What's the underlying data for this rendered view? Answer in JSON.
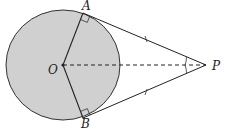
{
  "diagram": {
    "type": "geometry",
    "points": {
      "O": {
        "label": "O",
        "x": 63,
        "y": 65
      },
      "A": {
        "label": "A",
        "x": 83,
        "y": 13
      },
      "B": {
        "label": "B",
        "x": 83,
        "y": 118
      },
      "P": {
        "label": "P",
        "x": 206,
        "y": 65
      }
    },
    "circle": {
      "cx": 63,
      "cy": 65,
      "rx": 57,
      "ry": 55,
      "fill": "#d0d0d0",
      "stroke": "#333333"
    },
    "segments": [
      {
        "from": "O",
        "to": "A",
        "style": "solid"
      },
      {
        "from": "O",
        "to": "B",
        "style": "solid"
      },
      {
        "from": "A",
        "to": "P",
        "style": "solid",
        "tick_marks": 1
      },
      {
        "from": "B",
        "to": "P",
        "style": "solid",
        "tick_marks": 1
      },
      {
        "from": "O",
        "to": "P",
        "style": "dashed"
      }
    ],
    "right_angles": [
      "OAP",
      "OBP"
    ],
    "angle_marks": [
      "APO",
      "BPO"
    ],
    "colors": {
      "line": "#333333",
      "fill": "#d0d0d0"
    }
  }
}
